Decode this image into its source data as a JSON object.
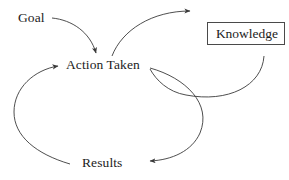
{
  "diagram": {
    "background_color": "#ffffff",
    "line_color": "#3a3a3a",
    "text_color": "#1c1c1c",
    "nodes": [
      {
        "id": "goal",
        "label": "Goal",
        "shape": "text"
      },
      {
        "id": "action_taken",
        "label": "Action Taken",
        "shape": "text"
      },
      {
        "id": "results",
        "label": "Results",
        "shape": "text"
      },
      {
        "id": "knowledge",
        "label": "Knowledge",
        "shape": "box",
        "border_color": "#4a4a4a"
      }
    ],
    "edges": [
      {
        "id": "goal-to-action",
        "from": "goal",
        "to": "action_taken",
        "style": "curved-arrow"
      },
      {
        "id": "action-to-knowledge",
        "from": "action_taken",
        "to": "knowledge",
        "style": "curved-arrow"
      },
      {
        "id": "knowledge-to-action",
        "from": "knowledge",
        "to": "action_taken",
        "style": "curved-arrow"
      },
      {
        "id": "action-to-results",
        "from": "action_taken",
        "to": "results",
        "style": "curved-arrow"
      },
      {
        "id": "results-to-action",
        "from": "results",
        "to": "action_taken",
        "style": "curved-arrow"
      }
    ]
  }
}
